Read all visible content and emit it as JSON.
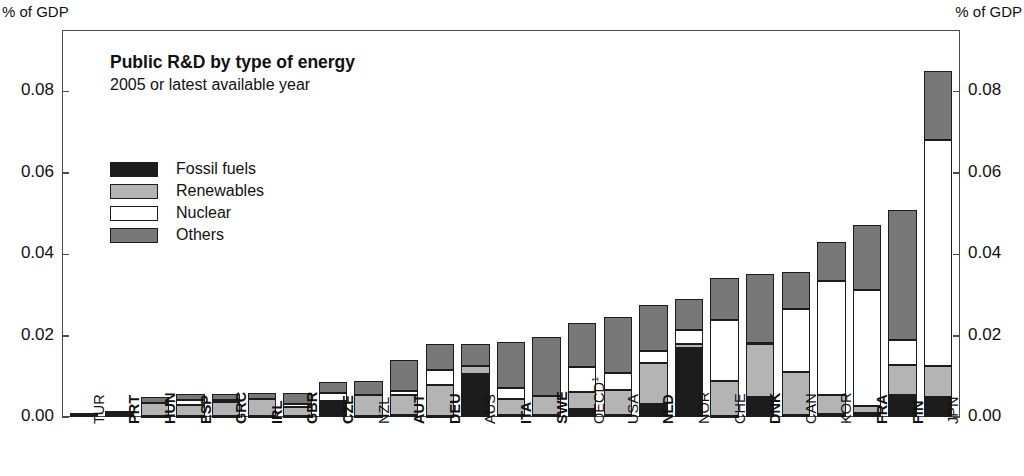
{
  "axis_unit_left": "% of GDP",
  "axis_unit_right": "% of GDP",
  "title": "Public R&D by type of energy",
  "subtitle": "2005 or latest available year",
  "legend": [
    {
      "label": "Fossil fuels",
      "color": "#1c1c1c"
    },
    {
      "label": "Renewables",
      "color": "#b4b4b4"
    },
    {
      "label": "Nuclear",
      "color": "#ffffff"
    },
    {
      "label": "Others",
      "color": "#787878"
    }
  ],
  "chart_data": {
    "type": "bar",
    "stacked": true,
    "title": "Public R&D by type of energy",
    "subtitle": "2005 or latest available year",
    "xlabel": "",
    "ylabel": "% of GDP",
    "ylim": [
      0.0,
      0.09
    ],
    "yticks": [
      0.0,
      0.02,
      0.04,
      0.06,
      0.08
    ],
    "ytick_labels": [
      "0.00",
      "0.02",
      "0.04",
      "0.06",
      "0.08"
    ],
    "grid": false,
    "legend_position": "upper-left-inside",
    "categories": [
      "TUR",
      "PRT",
      "HUN",
      "ESP",
      "GRC",
      "IRL",
      "GBR",
      "CZE",
      "NZL",
      "AUT",
      "DEU",
      "AUS",
      "ITA",
      "SWE",
      "OECD",
      "USA",
      "NLD",
      "NOR",
      "CHE",
      "DNK",
      "CAN",
      "KOR",
      "FRA",
      "FIN",
      "JPN"
    ],
    "category_bold": [
      false,
      true,
      true,
      true,
      true,
      true,
      true,
      true,
      false,
      true,
      true,
      false,
      true,
      true,
      false,
      false,
      true,
      false,
      false,
      true,
      false,
      false,
      true,
      true,
      false
    ],
    "category_footnote": {
      "OECD": "1"
    },
    "series": [
      {
        "name": "Fossil fuels",
        "color": "#1c1c1c",
        "values": [
          0.001,
          0.0014,
          0.0002,
          0.0003,
          0.0002,
          0.0002,
          0.0003,
          0.0035,
          0.0002,
          0.0004,
          0.0003,
          0.0105,
          0.0005,
          0.0004,
          0.002,
          0.0006,
          0.0032,
          0.017,
          0.0003,
          0.0048,
          0.0005,
          0.0007,
          0.001,
          0.0055,
          0.005
        ]
      },
      {
        "name": "Renewables",
        "color": "#b4b4b4",
        "values": [
          0.0,
          0.0,
          0.0032,
          0.0026,
          0.0036,
          0.0043,
          0.0022,
          0.0005,
          0.0053,
          0.005,
          0.0075,
          0.002,
          0.0038,
          0.0048,
          0.0042,
          0.006,
          0.01,
          0.001,
          0.0085,
          0.013,
          0.0106,
          0.0046,
          0.0017,
          0.0073,
          0.0075
        ]
      },
      {
        "name": "Nuclear",
        "color": "#ffffff",
        "values": [
          0.0,
          0.0,
          0.0,
          0.0012,
          0.0003,
          0.0,
          0.0007,
          0.002,
          0.0,
          0.0009,
          0.0038,
          0.0,
          0.0027,
          0.0,
          0.006,
          0.0042,
          0.003,
          0.0033,
          0.015,
          0.0004,
          0.0155,
          0.028,
          0.0285,
          0.006,
          0.0555
        ]
      },
      {
        "name": "Others",
        "color": "#787878",
        "values": [
          0.0,
          0.0,
          0.0014,
          0.0016,
          0.0015,
          0.0013,
          0.0028,
          0.0026,
          0.0033,
          0.0077,
          0.0064,
          0.0055,
          0.0115,
          0.0145,
          0.0108,
          0.0138,
          0.0113,
          0.0077,
          0.0102,
          0.0168,
          0.009,
          0.0097,
          0.016,
          0.032,
          0.017
        ]
      }
    ]
  }
}
